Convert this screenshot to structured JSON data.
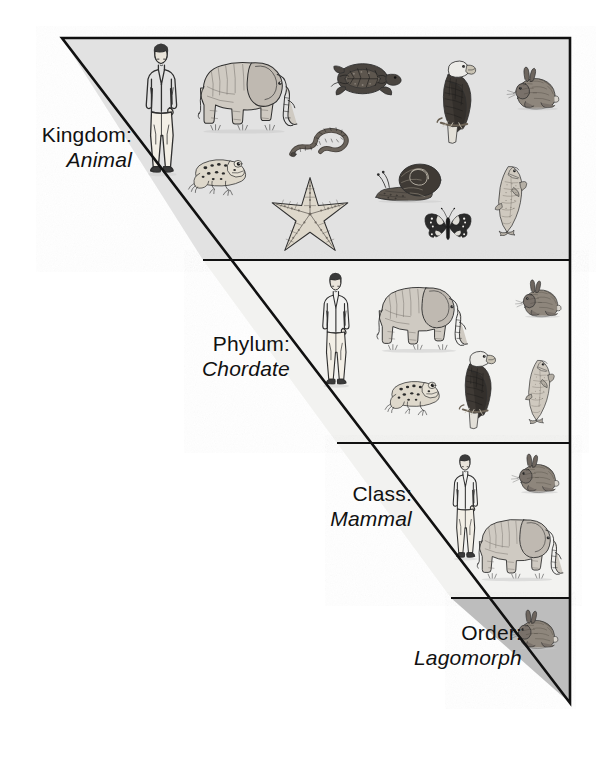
{
  "figure": {
    "type": "taxonomic-hierarchy-diagram",
    "shape": "inverted-right-triangle",
    "colors": {
      "outline": "#111111",
      "page_background": "#ffffff",
      "band_kingdom_fill": "#e2e2e2",
      "band_phylum_fill": "#f2f2f0",
      "band_class_fill": "#f2f2f0",
      "band_order_fill": "#bdbdbd",
      "ink": "#2b2b2b",
      "label_text": "#111111"
    },
    "geometry": {
      "apex_left_x": 62,
      "top_y": 38,
      "right_x": 570,
      "bottom_tip_y": 703,
      "divider_y": [
        260,
        443,
        598
      ]
    }
  },
  "ranks": [
    {
      "id": "kingdom",
      "rank_name": "Kingdom:",
      "rank_value": "Animal",
      "band_index": 0,
      "organisms": [
        "human",
        "elephant",
        "turtle",
        "eagle",
        "rabbit",
        "frog",
        "worm",
        "starfish",
        "snail",
        "butterfly",
        "fish"
      ],
      "organism_count": 11
    },
    {
      "id": "phylum",
      "rank_name": "Phylum:",
      "rank_value": "Chordate",
      "band_index": 1,
      "organisms": [
        "human",
        "elephant",
        "rabbit",
        "frog",
        "eagle",
        "fish"
      ],
      "organism_count": 6
    },
    {
      "id": "class",
      "rank_name": "Class:",
      "rank_value": "Mammal",
      "band_index": 2,
      "organisms": [
        "human",
        "rabbit",
        "elephant"
      ],
      "organism_count": 3
    },
    {
      "id": "order",
      "rank_name": "Order:",
      "rank_value": "Lagomorph",
      "band_index": 3,
      "organisms": [
        "rabbit"
      ],
      "organism_count": 1
    }
  ]
}
